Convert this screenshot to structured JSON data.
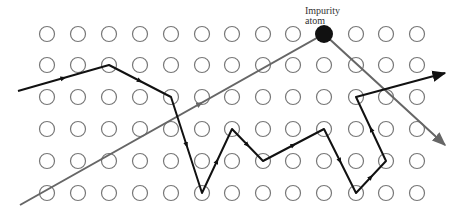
{
  "diagram": {
    "labels": {
      "impurity_line1": "Impurity",
      "impurity_line2": "atom"
    },
    "lattice": {
      "columns_x": [
        47,
        78,
        109,
        140,
        171,
        202,
        232,
        263,
        293,
        324,
        356,
        386,
        417
      ],
      "rows_y": [
        34,
        65,
        97,
        129,
        161,
        193
      ],
      "atom_radius": 7.5,
      "atom_stroke": "#777777",
      "atom_fill": "#ffffff"
    },
    "impurity_atom": {
      "x": 324,
      "y": 34,
      "radius": 9,
      "fill": "#111111"
    },
    "scattered_path": {
      "color": "#111111",
      "points": [
        [
          18,
          91
        ],
        [
          109,
          65
        ],
        [
          171,
          97
        ],
        [
          202,
          193
        ],
        [
          232,
          129
        ],
        [
          263,
          161
        ],
        [
          324,
          129
        ],
        [
          356,
          193
        ],
        [
          386,
          161
        ],
        [
          356,
          97
        ],
        [
          445,
          73
        ]
      ]
    },
    "straight_path": {
      "color": "#666666",
      "points": [
        [
          20,
          205
        ],
        [
          324,
          34
        ],
        [
          445,
          145
        ]
      ]
    }
  }
}
